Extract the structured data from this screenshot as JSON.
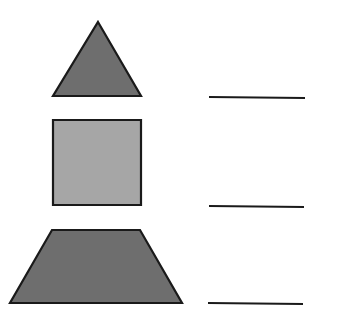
{
  "worksheet": {
    "shapes": [
      {
        "name": "triangle",
        "fill": "#6e6e6e",
        "stroke": "#1a1a1a",
        "points": "98,22 141,96 53,96"
      },
      {
        "name": "square",
        "fill": "#a6a6a6",
        "stroke": "#1a1a1a",
        "points": "53,120 141,120 141,205 53,205"
      },
      {
        "name": "trapezoid",
        "fill": "#6e6e6e",
        "stroke": "#1a1a1a",
        "points": "52,230 140,230 182,303 10,303"
      }
    ],
    "answer_lines": [
      {
        "x1": 209,
        "y1": 97,
        "x2": 305,
        "y2": 98
      },
      {
        "x1": 209,
        "y1": 206,
        "x2": 304,
        "y2": 207
      },
      {
        "x1": 208,
        "y1": 303,
        "x2": 303,
        "y2": 304
      }
    ],
    "colors": {
      "dark_fill": "#6e6e6e",
      "light_fill": "#a6a6a6",
      "stroke": "#1a1a1a",
      "background": "#ffffff"
    }
  }
}
